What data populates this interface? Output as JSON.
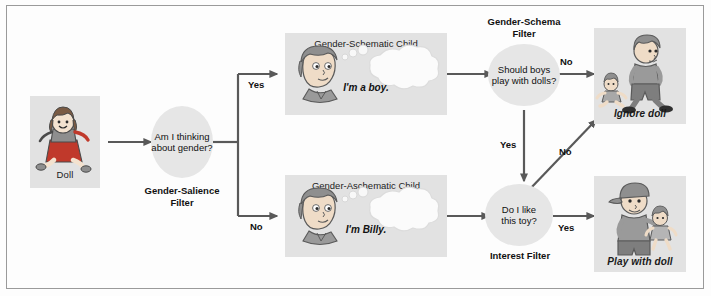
{
  "figure": {
    "background_color": "#fdfdfd",
    "border_color": "#9a9a9a",
    "panel_color": "#e2e2e2",
    "node_color": "#e6e6e6",
    "wire_color": "#595959"
  },
  "stimulus": {
    "caption": "Doll"
  },
  "nodes": {
    "salience": {
      "question_line1": "Am I thinking",
      "question_line2": "about gender?",
      "filter_line1": "Gender-Salience",
      "filter_line2": "Filter"
    },
    "schema": {
      "question_line1": "Should boys",
      "question_line2": "play with dolls?",
      "filter_line1": "Gender-Schema",
      "filter_line2": "Filter"
    },
    "interest": {
      "question_line1": "Do I like",
      "question_line2": "this toy?",
      "filter_line1": "Interest Filter",
      "filter_line2": ""
    }
  },
  "children": {
    "schematic": {
      "title": "Gender-Schematic Child",
      "thought": "I'm a boy."
    },
    "aschematic": {
      "title": "Gender-Aschematic Child",
      "thought": "I'm Billy."
    }
  },
  "outcomes": {
    "ignore": {
      "caption": "Ignore doll"
    },
    "play": {
      "caption": "Play with doll"
    }
  },
  "edges": {
    "salience_yes": "Yes",
    "salience_no": "No",
    "schema_no": "No",
    "schema_yes": "Yes",
    "interest_no": "No",
    "interest_yes": "Yes"
  }
}
